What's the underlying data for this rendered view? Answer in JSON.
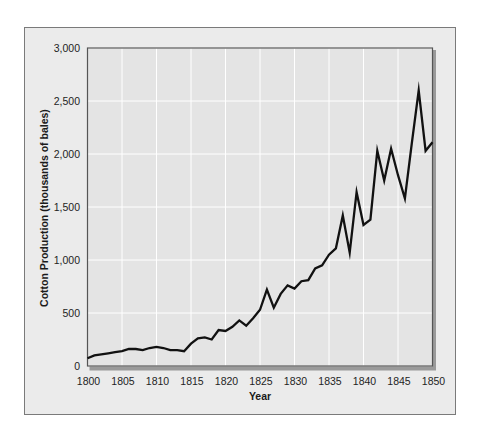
{
  "chart_data": {
    "type": "line",
    "title": "",
    "xlabel": "Year",
    "ylabel": "Cotton Production (thousands of bales)",
    "xlim": [
      1800,
      1850
    ],
    "ylim": [
      0,
      3000
    ],
    "grid": true,
    "legend": null,
    "x_ticks": [
      1800,
      1805,
      1810,
      1815,
      1820,
      1825,
      1830,
      1835,
      1840,
      1845,
      1850
    ],
    "x_tick_labels": [
      "1800",
      "1805",
      "1810",
      "1815",
      "1820",
      "1825",
      "1830",
      "1835",
      "1840",
      "1845",
      "1850"
    ],
    "y_ticks": [
      0,
      500,
      1000,
      1500,
      2000,
      2500,
      3000
    ],
    "y_tick_labels": [
      "0",
      "500",
      "1,000",
      "1,500",
      "2,000",
      "2,500",
      "3,000"
    ],
    "series": [
      {
        "name": "Cotton Production",
        "color": "#111111",
        "x": [
          1800,
          1801,
          1802,
          1803,
          1804,
          1805,
          1806,
          1807,
          1808,
          1809,
          1810,
          1811,
          1812,
          1813,
          1814,
          1815,
          1816,
          1817,
          1818,
          1819,
          1820,
          1821,
          1822,
          1823,
          1824,
          1825,
          1826,
          1827,
          1828,
          1829,
          1830,
          1831,
          1832,
          1833,
          1834,
          1835,
          1836,
          1837,
          1838,
          1839,
          1840,
          1841,
          1842,
          1843,
          1844,
          1845,
          1846,
          1847,
          1848,
          1849,
          1850
        ],
        "values": [
          73,
          100,
          110,
          120,
          130,
          140,
          160,
          160,
          150,
          170,
          180,
          170,
          150,
          150,
          140,
          210,
          260,
          270,
          250,
          340,
          330,
          370,
          430,
          380,
          450,
          530,
          720,
          550,
          680,
          760,
          730,
          800,
          810,
          920,
          950,
          1050,
          1110,
          1420,
          1070,
          1640,
          1330,
          1380,
          2030,
          1750,
          2050,
          1800,
          1580,
          2100,
          2600,
          2030,
          2110
        ]
      }
    ]
  },
  "colors": {
    "panel_bg": "#ebebeb",
    "plot_bg": "#e4e4e4",
    "grid": "#ffffff",
    "frame": "#555555",
    "shadow": "#9a9a9a",
    "line": "#111111"
  }
}
